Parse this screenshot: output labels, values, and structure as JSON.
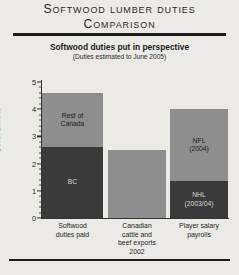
{
  "title": {
    "line1": "Softwood Lumber Duties",
    "line2": "Comparison"
  },
  "subtitle": {
    "main": "Softwood duties put in perspective",
    "note": "(Duties estimated to June 2005)"
  },
  "colors": {
    "background": "#ebeae6",
    "dark_segment": "#3a3a3a",
    "light_segment": "#8e8e8e",
    "rule": "#1b1b1b",
    "axis": "#333333"
  },
  "chart_data": {
    "type": "bar",
    "stacked": true,
    "title": "Softwood duties put in perspective",
    "subtitle": "(Duties estimated to June 2005)",
    "xlabel": "",
    "ylabel": "$U.S. Billions",
    "ylim": [
      0,
      5
    ],
    "yticks": [
      0,
      1,
      2,
      3,
      4,
      5
    ],
    "ytick_labels": [
      "0",
      "1",
      "2",
      "3",
      "4",
      "5"
    ],
    "minor_ticks": true,
    "grid": false,
    "legend": "none",
    "categories": [
      "Softwood\nduties paid",
      "Canadian\ncattle and\nbeef exports\n2002",
      "Player salary\npayrolls"
    ],
    "bars": [
      {
        "category": "Softwood\nduties paid",
        "total": 4.6,
        "segments": [
          {
            "name": "BC",
            "label": "BC",
            "value": 2.6,
            "shade": "dark"
          },
          {
            "name": "Rest of Canada",
            "label": "Rest of\nCanada",
            "value": 2.0,
            "shade": "light"
          }
        ]
      },
      {
        "category": "Canadian\ncattle and\nbeef exports\n2002",
        "total": 2.5,
        "segments": [
          {
            "name": "Canadian cattle and beef exports 2002",
            "label": "",
            "value": 2.5,
            "shade": "light"
          }
        ]
      },
      {
        "category": "Player salary\npayrolls",
        "total": 4.0,
        "segments": [
          {
            "name": "NHL (2003/04)",
            "label": "NHL\n(2003/04)",
            "value": 1.35,
            "shade": "dark"
          },
          {
            "name": "NFL (2004)",
            "label": "NFL\n(2004)",
            "value": 2.65,
            "shade": "light"
          }
        ]
      }
    ]
  }
}
